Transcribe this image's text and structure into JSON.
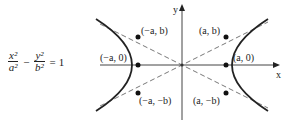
{
  "equation": {
    "term1_num": "x²",
    "term1_den": "a²",
    "minus": "−",
    "term2_num": "y²",
    "term2_den": "b²",
    "equals": "=",
    "rhs": "1"
  },
  "axes": {
    "x_label": "x",
    "y_label": "y"
  },
  "points": {
    "neg_a_b": "(−a, b)",
    "a_b": "(a, b)",
    "neg_a_0": "(−a, 0)",
    "a_0": "(a, 0)",
    "neg_a_neg_b": "(−a, −b)",
    "a_neg_b": "(a, −b)"
  }
}
